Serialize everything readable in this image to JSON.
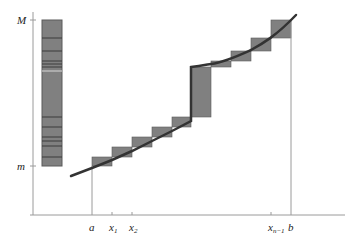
{
  "diagram": {
    "y_axis": {
      "top_label": "M",
      "bottom_label": "m"
    },
    "x_axis": {
      "labels": [
        {
          "text": "a",
          "sub": "",
          "x": 92
        },
        {
          "text": "x",
          "sub": "1",
          "x": 112
        },
        {
          "text": "x",
          "sub": "2",
          "x": 132
        },
        {
          "text": "x",
          "sub": "n−1",
          "x": 271
        },
        {
          "text": "b",
          "sub": "",
          "x": 291
        }
      ]
    },
    "colors": {
      "bar_fill": "#808080",
      "bar_stroke": "#5a5a5a",
      "curve": "#333333",
      "axis": "#999999",
      "range_bar_lines": "#3a3a3a"
    },
    "range_bar": {
      "x": 42,
      "top": 20,
      "bottom": 166,
      "width": 20,
      "partition_lines_y": [
        38,
        51,
        61,
        64,
        67,
        117,
        127,
        137,
        141,
        146,
        157
      ]
    },
    "steps": [
      {
        "x0": 92,
        "x1": 112,
        "low": 166,
        "high": 157
      },
      {
        "x0": 112,
        "x1": 132,
        "low": 157,
        "high": 147
      },
      {
        "x0": 132,
        "x1": 152,
        "low": 147,
        "high": 137
      },
      {
        "x0": 152,
        "x1": 172,
        "low": 137,
        "high": 127
      },
      {
        "x0": 172,
        "x1": 191,
        "low": 127,
        "high": 117
      },
      {
        "x0": 191,
        "x1": 211,
        "low": 117,
        "high": 67
      },
      {
        "x0": 211,
        "x1": 231,
        "low": 67,
        "high": 61
      },
      {
        "x0": 231,
        "x1": 251,
        "low": 61,
        "high": 51
      },
      {
        "x0": 251,
        "x1": 271,
        "low": 51,
        "high": 38
      },
      {
        "x0": 271,
        "x1": 291,
        "low": 38,
        "high": 20
      }
    ]
  }
}
